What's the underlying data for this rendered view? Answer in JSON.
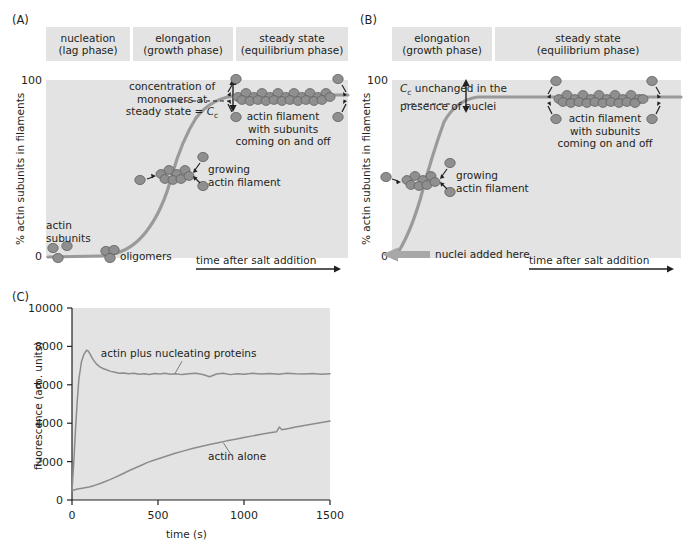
{
  "figure": {
    "panels": [
      {
        "id": "A",
        "label": "(A)",
        "phases": [
          {
            "line1": "nucleation",
            "line2": "(lag phase)"
          },
          {
            "line1": "elongation",
            "line2": "(growth phase)"
          },
          {
            "line1": "steady state",
            "line2": "(equilibrium phase)"
          }
        ],
        "y_axis_label": "% actin subunits in filaments",
        "y_ticks": [
          "100",
          "0"
        ],
        "x_axis_label": "time after salt addition",
        "annotations": {
          "cc_line1": "concentration of",
          "cc_line2": "monomers at",
          "cc_line3_prefix": "steady state = ",
          "cc_symbol": "C",
          "cc_subscript": "c",
          "filament_line1": "actin filament",
          "filament_line2": "with subunits",
          "filament_line3": "coming on and off",
          "growing_line1": "growing",
          "growing_line2": "actin filament",
          "subunits_line1": "actin",
          "subunits_line2": "subunits",
          "oligomers": "oligomers"
        }
      },
      {
        "id": "B",
        "label": "(B)",
        "phases": [
          {
            "line1": "elongation",
            "line2": "(growth phase)"
          },
          {
            "line1": "steady state",
            "line2": "(equilibrium phase)"
          }
        ],
        "y_axis_label": "% actin subunits in filaments",
        "y_ticks": [
          "100",
          "0"
        ],
        "x_axis_label": "time after salt addition",
        "annotations": {
          "cc_symbol": "C",
          "cc_subscript": "c",
          "cc_line1_suffix": " unchanged in the",
          "cc_line2": "presence of nuclei",
          "filament_line1": "actin filament",
          "filament_line2": "with subunits",
          "filament_line3": "coming on and off",
          "growing_line1": "growing",
          "growing_line2": "actin filament",
          "nuclei_added": "nuclei added here"
        }
      },
      {
        "id": "C",
        "label": "(C)"
      }
    ]
  },
  "chart_data": {
    "type": "line",
    "title": "",
    "xlabel": "time (s)",
    "ylabel": "fluorescence (arb. units)",
    "xlim": [
      0,
      1500
    ],
    "ylim": [
      0,
      10000
    ],
    "xticks": [
      0,
      500,
      1000,
      1500
    ],
    "xtick_labels": [
      "0",
      "500",
      "1000",
      "1500"
    ],
    "yticks": [
      0,
      2000,
      4000,
      6000,
      8000,
      10000
    ],
    "ytick_labels": [
      "0",
      "2000",
      "4000",
      "6000",
      "8000",
      "10000"
    ],
    "grid": false,
    "legend_position": "inline-annotation",
    "series": [
      {
        "name": "actin plus nucleating proteins",
        "color": "#8c8c8c",
        "x": [
          0,
          10,
          20,
          30,
          40,
          55,
          70,
          85,
          95,
          105,
          120,
          140,
          160,
          180,
          200,
          225,
          250,
          275,
          300,
          330,
          360,
          390,
          420,
          450,
          480,
          510,
          540,
          570,
          600,
          640,
          680,
          720,
          760,
          800,
          840,
          880,
          920,
          960,
          1000,
          1050,
          1100,
          1150,
          1200,
          1250,
          1300,
          1350,
          1400,
          1450,
          1500
        ],
        "y": [
          480,
          1900,
          3600,
          5100,
          6300,
          7200,
          7600,
          7800,
          7750,
          7600,
          7350,
          7100,
          6950,
          6850,
          6780,
          6700,
          6650,
          6600,
          6620,
          6570,
          6600,
          6550,
          6580,
          6540,
          6590,
          6560,
          6600,
          6550,
          6580,
          6530,
          6570,
          6600,
          6540,
          6420,
          6560,
          6600,
          6530,
          6580,
          6550,
          6600,
          6560,
          6590,
          6550,
          6600,
          6570,
          6560,
          6590,
          6550,
          6580
        ]
      },
      {
        "name": "actin alone",
        "color": "#8c8c8c",
        "x": [
          0,
          25,
          50,
          75,
          100,
          130,
          160,
          190,
          220,
          250,
          280,
          310,
          340,
          370,
          400,
          440,
          480,
          520,
          560,
          600,
          650,
          700,
          750,
          800,
          850,
          900,
          950,
          1000,
          1050,
          1100,
          1150,
          1190,
          1205,
          1220,
          1260,
          1300,
          1350,
          1400,
          1450,
          1500
        ],
        "y": [
          480,
          560,
          600,
          640,
          680,
          760,
          850,
          950,
          1060,
          1180,
          1300,
          1430,
          1560,
          1680,
          1800,
          1960,
          2080,
          2200,
          2320,
          2430,
          2560,
          2680,
          2790,
          2890,
          2980,
          3080,
          3170,
          3250,
          3340,
          3420,
          3500,
          3560,
          3800,
          3660,
          3720,
          3800,
          3880,
          3960,
          4040,
          4110
        ]
      }
    ],
    "annotations": [
      {
        "text": "actin plus nucleating proteins",
        "x": 620,
        "y": 7450
      },
      {
        "text": "actin alone",
        "x": 960,
        "y": 2100
      }
    ]
  }
}
